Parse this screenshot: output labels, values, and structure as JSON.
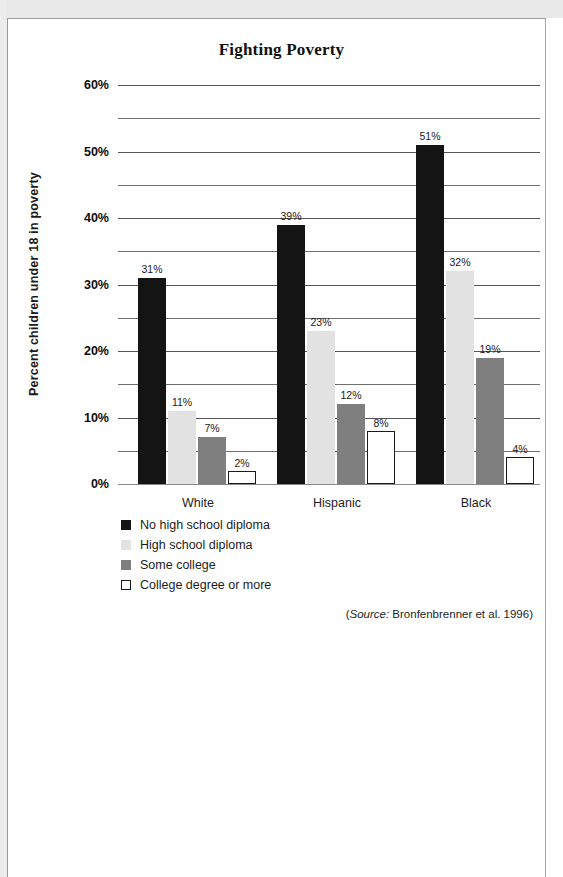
{
  "page": {
    "frame_color": "#9a9a9a",
    "sheet_color": "#ffffff"
  },
  "source_note": {
    "open_paren": "(",
    "label": "Source:",
    "citation": " Bronfenbrenner et al. 1996)"
  },
  "chart_data": {
    "type": "bar",
    "title": "Fighting Poverty",
    "xlabel": "",
    "ylabel": "Percent children under 18 in poverty",
    "categories": [
      "White",
      "Hispanic",
      "Black"
    ],
    "series": [
      {
        "name": "No high school diploma",
        "color": "#141414",
        "values": [
          31,
          39,
          51
        ],
        "labels": [
          "31%",
          "39%",
          "51%"
        ]
      },
      {
        "name": "High school diploma",
        "color": "#e2e2e2",
        "values": [
          11,
          23,
          32
        ],
        "labels": [
          "11%",
          "23%",
          "32%"
        ]
      },
      {
        "name": "Some college",
        "color": "#7f7f7f",
        "values": [
          7,
          12,
          19
        ],
        "labels": [
          "7%",
          "12%",
          "19%"
        ]
      },
      {
        "name": "College degree or more",
        "color": "#ffffff",
        "values": [
          2,
          8,
          4
        ],
        "labels": [
          "2%",
          "8%",
          "4%"
        ]
      }
    ],
    "ylim": [
      0,
      60
    ],
    "ytick_labels": [
      "0%",
      "10%",
      "20%",
      "30%",
      "40%",
      "50%",
      "60%"
    ],
    "ytick_values": [
      0,
      10,
      20,
      30,
      40,
      50,
      60
    ],
    "minor_gridline_values": [
      5,
      15,
      25,
      35,
      45,
      55
    ],
    "grid": true,
    "legend_position": "below-left",
    "value_labels_shown": true
  }
}
